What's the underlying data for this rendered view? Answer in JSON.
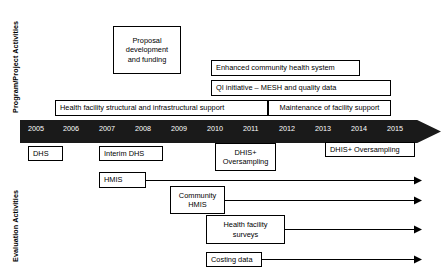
{
  "axes": {
    "program_label": "Program/Project Activities",
    "evaluation_label": "Evaluation Activities"
  },
  "timeline": {
    "colors": {
      "band": "#1a1a1a",
      "year_text": "#ffffff",
      "box_border": "#000000"
    },
    "years": [
      "2005",
      "2006",
      "2007",
      "2008",
      "2009",
      "2010",
      "2011",
      "2012",
      "2013",
      "2014",
      "2015"
    ]
  },
  "program_activities": [
    {
      "id": "proposal-development",
      "label": "Proposal\ndevelopment\nand funding"
    },
    {
      "id": "enhanced-community-health-system",
      "label": "Enhanced community health system"
    },
    {
      "id": "qi-initiative",
      "label": "QI initiative – MESH and quality data"
    },
    {
      "id": "health-facility-support",
      "label": "Health facility structural and infrastructural support"
    },
    {
      "id": "maintenance-of-facility-support",
      "label": "Maintenance of facility support"
    }
  ],
  "evaluation_activities": [
    {
      "id": "dhs",
      "label": "DHS"
    },
    {
      "id": "interim-dhs",
      "label": "Interim DHS"
    },
    {
      "id": "dhis-plus-oversampling-2010",
      "label": "DHIS+\nOversampling"
    },
    {
      "id": "dhis-plus-oversampling-2013",
      "label": "DHIS+ Oversampling"
    },
    {
      "id": "hmis",
      "label": "HMIS"
    },
    {
      "id": "community-hmis",
      "label": "Community\nHMIS"
    },
    {
      "id": "health-facility-surveys",
      "label": "Health facility\nsurveys"
    },
    {
      "id": "costing-data",
      "label": "Costing data"
    }
  ]
}
